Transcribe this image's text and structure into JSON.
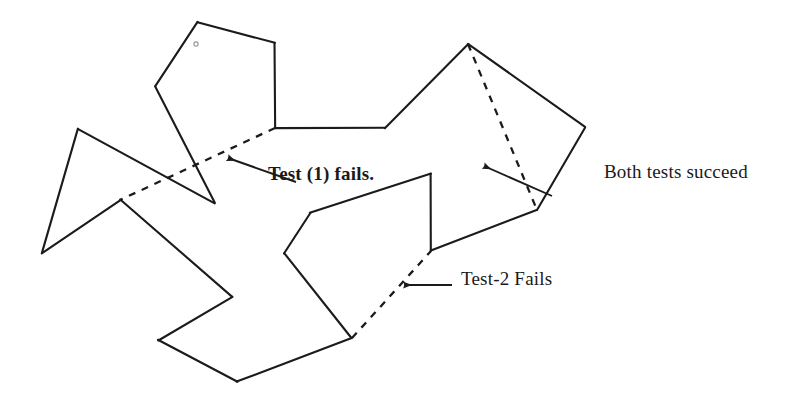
{
  "figure": {
    "kind": "hand-drawn-polygon-diagram",
    "width": 800,
    "height": 405,
    "background_color": "#ffffff",
    "ink_color": "#1b1b1b",
    "caption_font_color": "#1a1a1a"
  },
  "annotations": {
    "test1": {
      "label": "Test (1) fails.",
      "style": "bold",
      "arrow_from": [
        296,
        182
      ],
      "arrow_to": [
        228,
        158
      ]
    },
    "both": {
      "label": "Both tests succeed",
      "style": "plain",
      "arrow_from": [
        552,
        196
      ],
      "arrow_to": [
        484,
        166
      ]
    },
    "test2": {
      "label": "Test-2 Fails",
      "style": "plain",
      "arrow_from": [
        452,
        285
      ],
      "arrow_to": [
        404,
        285
      ]
    }
  },
  "shape": {
    "outline_label": "polygon-outline",
    "solid_segments": [
      [
        [
          197,
          22
        ],
        [
          275,
          43
        ]
      ],
      [
        [
          275,
          43
        ],
        [
          275,
          128
        ]
      ],
      [
        [
          275,
          128
        ],
        [
          385,
          128
        ]
      ],
      [
        [
          385,
          128
        ],
        [
          468,
          44
        ]
      ],
      [
        [
          468,
          44
        ],
        [
          585,
          127
        ]
      ],
      [
        [
          585,
          127
        ],
        [
          537,
          210
        ]
      ],
      [
        [
          537,
          210
        ],
        [
          431,
          251
        ]
      ],
      [
        [
          431,
          251
        ],
        [
          431,
          174
        ]
      ],
      [
        [
          431,
          174
        ],
        [
          310,
          213
        ]
      ],
      [
        [
          310,
          213
        ],
        [
          284,
          253
        ]
      ],
      [
        [
          284,
          253
        ],
        [
          352,
          338
        ]
      ],
      [
        [
          352,
          338
        ],
        [
          237,
          382
        ]
      ],
      [
        [
          237,
          382
        ],
        [
          158,
          340
        ]
      ],
      [
        [
          158,
          340
        ],
        [
          232,
          297
        ]
      ],
      [
        [
          232,
          297
        ],
        [
          120,
          200
        ]
      ],
      [
        [
          120,
          200
        ],
        [
          42,
          253
        ]
      ],
      [
        [
          42,
          253
        ],
        [
          78,
          129
        ]
      ],
      [
        [
          78,
          129
        ],
        [
          215,
          203
        ]
      ],
      [
        [
          215,
          203
        ],
        [
          155,
          86
        ]
      ],
      [
        [
          155,
          86
        ],
        [
          197,
          22
        ]
      ]
    ],
    "dashed_segments": [
      [
        [
          275,
          128
        ],
        [
          120,
          200
        ]
      ],
      [
        [
          468,
          44
        ],
        [
          537,
          210
        ]
      ],
      [
        [
          352,
          338
        ],
        [
          431,
          251
        ]
      ]
    ],
    "dot_marker": [
      196,
      44
    ]
  }
}
